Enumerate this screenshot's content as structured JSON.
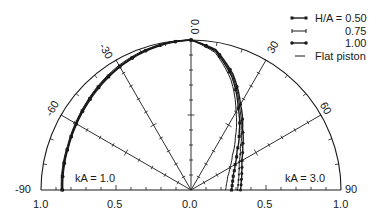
{
  "chart_data": {
    "type": "polar-line",
    "title": "",
    "layout": {
      "center": [
        191,
        190
      ],
      "radius": 150,
      "angle_range_deg": [
        -90,
        90
      ],
      "radial_range": [
        0,
        1.0
      ],
      "grid": "radial spokes every 30 deg, outer semicircle"
    },
    "angle_tick_labels": [
      "-90",
      "-60",
      "-30",
      "0.0",
      "30",
      "60",
      "90"
    ],
    "angle_ticks_deg": [
      -90,
      -60,
      -30,
      0,
      30,
      60,
      90
    ],
    "radial_tick_labels_left": [
      "1.0",
      "0.5"
    ],
    "radial_tick_labels_right": [
      "0.5",
      "1.0"
    ],
    "center_label": "0.0",
    "annotations": [
      {
        "text": "kA = 1.0",
        "side": "left"
      },
      {
        "text": "kA = 3.0",
        "side": "right"
      }
    ],
    "legend": [
      {
        "label": "H/A = 0.50",
        "style": "line-square-markers"
      },
      {
        "label": "0.75",
        "style": "line-tick-markers"
      },
      {
        "label": "1.00",
        "style": "line-dot-markers"
      },
      {
        "label": "Flat piston",
        "style": "plain-line"
      }
    ],
    "series": [
      {
        "name": "kA = 1.0 (left half, all H/A nearly coincident)",
        "side": "left",
        "angles_deg": [
          0,
          -10,
          -20,
          -30,
          -40,
          -50,
          -60,
          -70,
          -80,
          -90
        ],
        "curves": [
          {
            "name": "Flat piston",
            "r": [
              1.0,
              0.995,
              0.98,
              0.96,
              0.935,
              0.91,
              0.89,
              0.875,
              0.87,
              0.865
            ]
          },
          {
            "name": "H/A = 0.50",
            "r": [
              1.0,
              0.993,
              0.975,
              0.952,
              0.93,
              0.905,
              0.885,
              0.87,
              0.865,
              0.86
            ]
          },
          {
            "name": "H/A = 0.75",
            "r": [
              1.0,
              0.99,
              0.972,
              0.95,
              0.925,
              0.9,
              0.882,
              0.868,
              0.862,
              0.858
            ]
          },
          {
            "name": "H/A = 1.00",
            "r": [
              1.0,
              0.988,
              0.97,
              0.947,
              0.922,
              0.898,
              0.88,
              0.866,
              0.86,
              0.855
            ]
          }
        ]
      },
      {
        "name": "kA = 3.0 (right half)",
        "side": "right",
        "angles_deg": [
          0,
          10,
          20,
          30,
          40,
          50,
          60,
          70,
          80,
          90
        ],
        "curves": [
          {
            "name": "Flat piston",
            "r": [
              1.0,
              0.93,
              0.78,
              0.6,
              0.46,
              0.36,
              0.3,
              0.26,
              0.24,
              0.23
            ]
          },
          {
            "name": "H/A = 0.50",
            "r": [
              1.0,
              0.94,
              0.8,
              0.63,
              0.5,
              0.4,
              0.34,
              0.3,
              0.28,
              0.27
            ]
          },
          {
            "name": "H/A = 0.75",
            "r": [
              1.0,
              0.945,
              0.81,
              0.645,
              0.52,
              0.43,
              0.37,
              0.34,
              0.32,
              0.31
            ]
          },
          {
            "name": "H/A = 1.00",
            "r": [
              1.0,
              0.95,
              0.82,
              0.66,
              0.535,
              0.45,
              0.39,
              0.36,
              0.34,
              0.33
            ]
          }
        ]
      }
    ]
  }
}
